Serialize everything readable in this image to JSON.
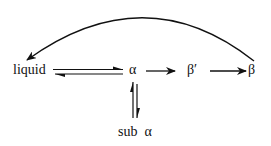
{
  "diagram": {
    "type": "phase-transition-scheme",
    "nodes": [
      {
        "id": "liquid",
        "label": "liquid"
      },
      {
        "id": "alpha",
        "label": "α"
      },
      {
        "id": "beta_prime",
        "label": "β′"
      },
      {
        "id": "beta",
        "label": "β"
      },
      {
        "id": "sub_alpha",
        "label": "sub  α"
      }
    ],
    "edges": [
      {
        "from": "liquid",
        "to": "alpha",
        "kind": "equilibrium"
      },
      {
        "from": "alpha",
        "to": "beta_prime",
        "kind": "forward"
      },
      {
        "from": "beta_prime",
        "to": "beta",
        "kind": "forward"
      },
      {
        "from": "alpha",
        "to": "sub_alpha",
        "kind": "equilibrium"
      },
      {
        "from": "beta",
        "to": "liquid",
        "kind": "curved-forward"
      }
    ],
    "colors": {
      "stroke": "#111111",
      "background": "#ffffff"
    }
  }
}
